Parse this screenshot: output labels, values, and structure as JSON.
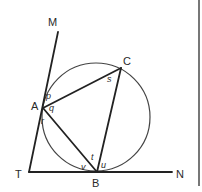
{
  "diagram": {
    "points": {
      "M": {
        "label": "M",
        "x": 58,
        "y": 32,
        "lx": 48,
        "ly": 26
      },
      "C": {
        "label": "C",
        "x": 121,
        "y": 68,
        "lx": 123,
        "ly": 65
      },
      "A": {
        "label": "A",
        "x": 43,
        "y": 108,
        "lx": 31,
        "ly": 110
      },
      "T": {
        "label": "T",
        "x": 29,
        "y": 172,
        "lx": 15,
        "ly": 178
      },
      "B": {
        "label": "B",
        "x": 97,
        "y": 172,
        "lx": 92,
        "ly": 187
      },
      "N": {
        "label": "N",
        "x": 172,
        "y": 172,
        "lx": 176,
        "ly": 178
      }
    },
    "circle": {
      "cx": 96,
      "cy": 117,
      "r": 54
    },
    "angles": [
      {
        "label": "p",
        "x": 46,
        "y": 99
      },
      {
        "label": "q",
        "x": 49,
        "y": 110
      },
      {
        "label": "r",
        "x": 41,
        "y": 123
      },
      {
        "label": "s",
        "x": 108,
        "y": 81
      },
      {
        "label": "t",
        "x": 91,
        "y": 160
      },
      {
        "label": "u",
        "x": 101,
        "y": 168
      },
      {
        "label": "v",
        "x": 82,
        "y": 170
      }
    ],
    "segments": [
      {
        "name": "tangent-TM",
        "from": "T",
        "to": "M"
      },
      {
        "name": "tangent-TN",
        "from": "T",
        "to": "N"
      },
      {
        "name": "chord-AC",
        "from": "A",
        "to": "C"
      },
      {
        "name": "chord-CB",
        "from": "C",
        "to": "B"
      },
      {
        "name": "chord-AB",
        "from": "A",
        "to": "B"
      }
    ],
    "colors": {
      "ink": "#222222",
      "circle": "#444444",
      "background": "#ffffff"
    }
  }
}
